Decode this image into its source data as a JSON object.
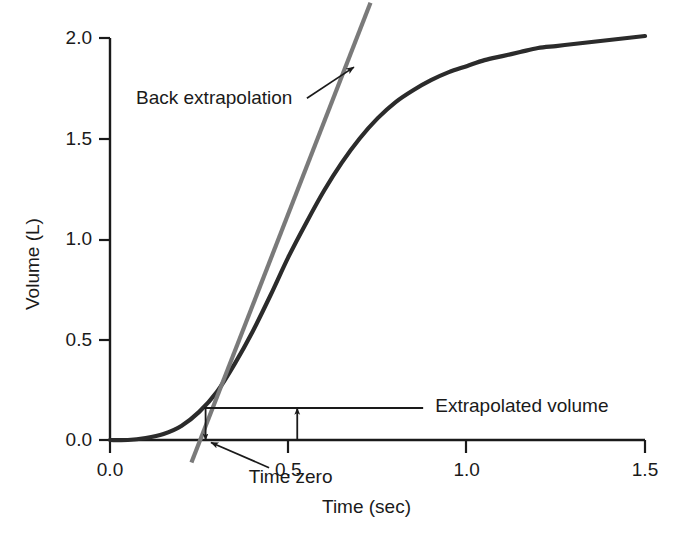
{
  "chart_data": {
    "type": "line",
    "title": "",
    "xlabel": "Time (sec)",
    "ylabel": "Volume (L)",
    "xlim": [
      0.0,
      1.5
    ],
    "ylim": [
      0.0,
      2.0
    ],
    "xticks": [
      "0.0",
      "0.5",
      "1.0",
      "1.5"
    ],
    "xtick_values": [
      0.0,
      0.5,
      1.0,
      1.5
    ],
    "yticks": [
      "0.0",
      "0.5",
      "1.0",
      "1.5",
      "2.0"
    ],
    "ytick_values": [
      0.0,
      0.5,
      1.0,
      1.5,
      2.0
    ],
    "grid": false,
    "legend": "none",
    "series": [
      {
        "name": "Volume curve",
        "color": "#2b2b2b",
        "style": "solid",
        "x": [
          0.0,
          0.05,
          0.1,
          0.15,
          0.2,
          0.25,
          0.3,
          0.35,
          0.4,
          0.45,
          0.5,
          0.55,
          0.6,
          0.65,
          0.7,
          0.75,
          0.8,
          0.85,
          0.9,
          0.95,
          1.0,
          1.05,
          1.1,
          1.15,
          1.2,
          1.25,
          1.3,
          1.35,
          1.4,
          1.45,
          1.5
        ],
        "values": [
          0.0,
          0.0,
          0.01,
          0.03,
          0.07,
          0.14,
          0.24,
          0.38,
          0.54,
          0.72,
          0.91,
          1.08,
          1.24,
          1.38,
          1.5,
          1.6,
          1.68,
          1.74,
          1.79,
          1.83,
          1.86,
          1.89,
          1.91,
          1.93,
          1.95,
          1.96,
          1.97,
          1.98,
          1.99,
          2.0,
          2.01
        ]
      },
      {
        "name": "Back extrapolation tangent",
        "color": "#7a7a7a",
        "style": "solid",
        "x": [
          0.2283,
          0.7303
        ],
        "values": [
          -0.112,
          2.175
        ]
      }
    ],
    "annotations": [
      {
        "name": "back-extrapolation",
        "text": "Back extrapolation",
        "text_x": 0.073,
        "text_y": 1.695,
        "arrow_from_x": 0.552,
        "arrow_from_y": 1.7,
        "arrow_to_x": 0.684,
        "arrow_to_y": 1.855
      },
      {
        "name": "time-zero",
        "text": "Time zero",
        "text_x": 0.389,
        "text_y": -0.19,
        "arrow_from_x": 0.446,
        "arrow_from_y": -0.138,
        "arrow_to_x": 0.283,
        "arrow_to_y": -0.012
      },
      {
        "name": "extrapolated-volume",
        "text": "Extrapolated volume",
        "text_x": 0.912,
        "text_y": 0.165,
        "level_line_from_x": 0.264,
        "level_line_to_x": 0.878,
        "level_line_y": 0.159,
        "measure_arrow_x": 0.525,
        "measure_arrow_from_y": 0.0,
        "measure_arrow_to_y": 0.159,
        "drop_arrow_x": 0.268,
        "drop_arrow_from_y": 0.159,
        "drop_arrow_to_y": 0.0
      }
    ],
    "colors": {
      "curve": "#2b2b2b",
      "tangent": "#7a7a7a",
      "axis": "#1a1a1a",
      "text": "#1a1a1a",
      "background": "#ffffff"
    }
  }
}
